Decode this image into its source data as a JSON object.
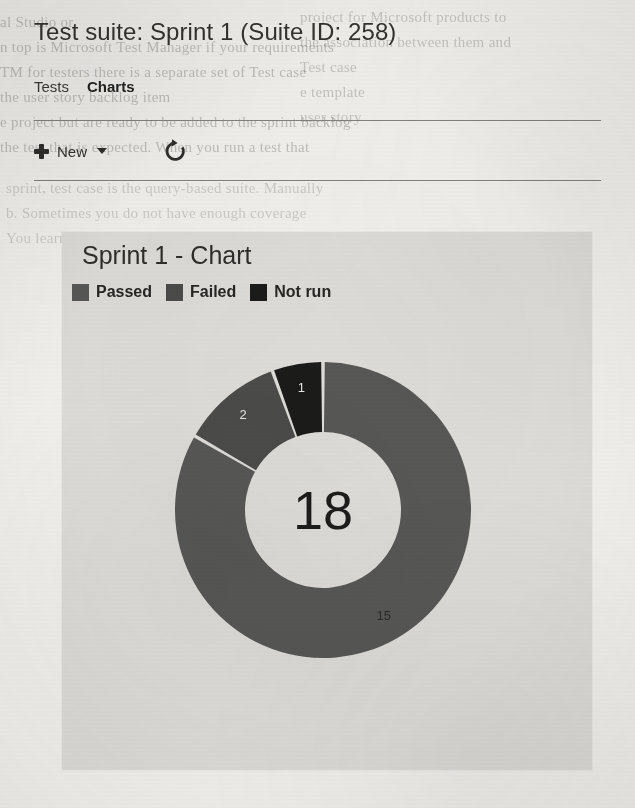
{
  "header": {
    "suite_title": "Test suite: Sprint 1 (Suite ID: 258)"
  },
  "tabs": [
    {
      "label": "Tests",
      "active": false,
      "name": "tab-tests"
    },
    {
      "label": "Charts",
      "active": true,
      "name": "tab-charts"
    }
  ],
  "toolbar": {
    "new_label": "New",
    "new_icon": "plus-icon",
    "new_caret_icon": "chevron-down-icon",
    "refresh_icon": "refresh-icon"
  },
  "card": {
    "title": "Sprint 1 - Chart"
  },
  "chart_data": {
    "type": "pie",
    "variant": "donut",
    "title": "Sprint 1 - Chart",
    "center_label": "18",
    "total": 18,
    "categories": [
      "Passed",
      "Failed",
      "Not run"
    ],
    "values": [
      15,
      2,
      1
    ],
    "labels": [
      "15",
      "2",
      "1"
    ],
    "colors": [
      "#575755",
      "#4b4b49",
      "#1b1b19"
    ],
    "label_colors": [
      "#2b2b29",
      "#e8e7e4",
      "#e8e7e4"
    ],
    "legend_position": "top-left",
    "grid": false,
    "start_angle_deg": 0,
    "direction": "clockwise",
    "slice_angles_deg": [
      300,
      40,
      20
    ],
    "slice_percent": [
      83.3,
      11.1,
      5.6
    ],
    "geometry": {
      "cx": 150,
      "cy": 150,
      "outer_r": 148,
      "inner_r": 78,
      "gap_deg": 1.4
    },
    "series": [
      {
        "name": "Passed",
        "value": 15,
        "color": "#575755"
      },
      {
        "name": "Failed",
        "value": 2,
        "color": "#4b4b49"
      },
      {
        "name": "Not run",
        "value": 1,
        "color": "#1b1b19"
      }
    ]
  },
  "ghost_text": {
    "lines": [
      "al Studio or",
      "n top is Microsoft Test Manager if your requirements",
      "TM for testers there is a separate set of Test case",
      "the user story backlog item",
      "e project but are ready to be added to the sprint backlog",
      "the test that is expected. When you run a test that",
      "sprint, test case is the query-based suite. Manually",
      "b. Sometimes you do not have enough coverage",
      "You learn a lot of key automation"
    ],
    "right_lines": [
      "project for Microsoft products to",
      "the association between them and",
      "Test case",
      "e template",
      "user story"
    ]
  }
}
